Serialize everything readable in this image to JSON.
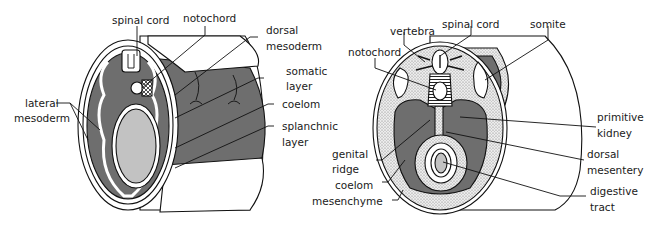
{
  "figure": {
    "panels": [
      {
        "id": "left",
        "description": "early embryo cross-section cylinder",
        "labels": [
          {
            "key": "spinal_cord",
            "lines": [
              "spinal cord"
            ]
          },
          {
            "key": "notochord",
            "lines": [
              "notochord"
            ]
          },
          {
            "key": "dorsal_mesoderm",
            "lines": [
              "dorsal",
              "mesoderm"
            ]
          },
          {
            "key": "somatic_layer",
            "lines": [
              "somatic",
              "layer"
            ]
          },
          {
            "key": "coelom",
            "lines": [
              "coelom"
            ]
          },
          {
            "key": "splanchnic_layer",
            "lines": [
              "splanchnic",
              "layer"
            ]
          },
          {
            "key": "lateral_mesoderm",
            "lines": [
              "lateral",
              "mesoderm"
            ]
          }
        ]
      },
      {
        "id": "right",
        "description": "later embryo cross-section cylinder",
        "labels": [
          {
            "key": "vertebra",
            "lines": [
              "vertebra"
            ]
          },
          {
            "key": "spinal_cord",
            "lines": [
              "spinal cord"
            ]
          },
          {
            "key": "somite",
            "lines": [
              "somite"
            ]
          },
          {
            "key": "notochord",
            "lines": [
              "notochord"
            ]
          },
          {
            "key": "primitive_kidney",
            "lines": [
              "primitive",
              "kidney"
            ]
          },
          {
            "key": "genital_ridge",
            "lines": [
              "genital",
              "ridge"
            ]
          },
          {
            "key": "dorsal_mesentery",
            "lines": [
              "dorsal",
              "mesentery"
            ]
          },
          {
            "key": "coelom",
            "lines": [
              "coelom"
            ]
          },
          {
            "key": "digestive_tract",
            "lines": [
              "digestive",
              "tract"
            ]
          },
          {
            "key": "mesenchyme",
            "lines": [
              "mesenchyme"
            ]
          }
        ]
      }
    ],
    "colors": {
      "dark_tissue": "#6e6e6e",
      "light_lumen": "#c2c2c2",
      "stipple_bg": "#e4e4e4",
      "outline": "#111111",
      "background": "#ffffff"
    }
  }
}
